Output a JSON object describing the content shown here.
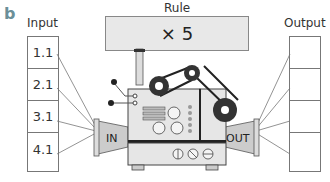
{
  "figure": {
    "panel_label": "b",
    "rule": {
      "title": "Rule",
      "operation": "× 5"
    },
    "input": {
      "title": "Input",
      "values": [
        "1.1",
        "2.1",
        "3.1",
        "4.1"
      ]
    },
    "output": {
      "title": "Output",
      "values": [
        "",
        "",
        "",
        ""
      ]
    },
    "machine": {
      "in_label": "IN",
      "out_label": "OUT"
    }
  }
}
